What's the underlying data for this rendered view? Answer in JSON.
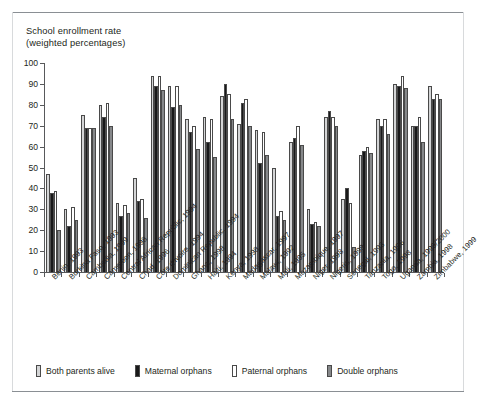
{
  "title": "School enrollment rate\n(weighted percentages)",
  "legend": {
    "items": [
      {
        "label": "Both parents alive",
        "color": "#d4d5d6"
      },
      {
        "label": "Maternal orphans",
        "color": "#19191a"
      },
      {
        "label": "Paternal orphans",
        "color": "#ffffff"
      },
      {
        "label": "Double orphans",
        "color": "#86888a"
      }
    ]
  },
  "chart_data": {
    "type": "bar",
    "title": "School enrollment rate (weighted percentages)",
    "xlabel": "",
    "ylabel": "School enrollment rate (weighted percentages)",
    "ylim": [
      0,
      100
    ],
    "yticks": [
      0,
      10,
      20,
      30,
      40,
      50,
      60,
      70,
      80,
      90,
      100
    ],
    "grid": false,
    "legend_position": "bottom",
    "categories": [
      "Benin, 1993",
      "Burkina Faso, 1993",
      "Cambodia, 1999",
      "Cameroon, 1998",
      "Central African Republic, 1994",
      "Chad, 1996",
      "Côte d'Ivoire, 1994",
      "Dominican Republic, 1994",
      "Ghana, 1998",
      "Haiti, 1994",
      "Kenya, 1998",
      "Madagascar, 1997",
      "Malawi, 1992",
      "Mali, 1995",
      "Mozambique, 1997",
      "Niger, 1998",
      "Nigeria, 1999",
      "Senegal, 1993",
      "Tanzania, 1996",
      "Togo, 1998",
      "Uganda, 1999/2000",
      "Zambia, 1998",
      "Zimbabwe, 1999"
    ],
    "series": [
      {
        "name": "Both parents alive",
        "color": "#d4d5d6",
        "values": [
          47,
          30,
          75,
          80,
          33,
          45,
          94,
          89,
          73,
          74,
          84,
          71,
          68,
          50,
          62,
          30,
          74,
          35,
          56,
          73,
          90,
          70,
          89
        ]
      },
      {
        "name": "Maternal orphans",
        "color": "#19191a",
        "values": [
          38,
          22,
          69,
          74,
          27,
          34,
          89,
          79,
          67,
          62,
          90,
          81,
          52,
          27,
          64,
          23,
          77,
          40,
          58,
          70,
          89,
          70,
          83
        ]
      },
      {
        "name": "Paternal orphans",
        "color": "#ffffff",
        "values": [
          39,
          31,
          69,
          81,
          32,
          35,
          94,
          89,
          70,
          73,
          85,
          83,
          67,
          29,
          70,
          24,
          74,
          33,
          60,
          73,
          94,
          74,
          85
        ]
      },
      {
        "name": "Double orphans",
        "color": "#86888a",
        "values": [
          20,
          25,
          69,
          70,
          28,
          26,
          87,
          80,
          59,
          55,
          73,
          70,
          56,
          25,
          61,
          22,
          70,
          12,
          57,
          66,
          88,
          62,
          83
        ]
      }
    ]
  }
}
